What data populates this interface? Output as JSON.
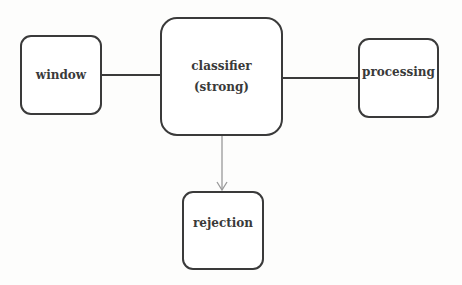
{
  "diagram": {
    "type": "flowchart",
    "nodes": [
      {
        "id": "window",
        "label": "window"
      },
      {
        "id": "classifier",
        "label": "classifier",
        "sublabel": "(strong)"
      },
      {
        "id": "processing",
        "label": "processing"
      },
      {
        "id": "rejection",
        "label": "rejection"
      }
    ],
    "edges": [
      {
        "from": "window",
        "to": "classifier",
        "style": "line",
        "color": "#3a3a3a"
      },
      {
        "from": "classifier",
        "to": "processing",
        "style": "line",
        "color": "#3a3a3a"
      },
      {
        "from": "classifier",
        "to": "rejection",
        "style": "arrow",
        "color": "#9a9a9a"
      }
    ]
  },
  "colors": {
    "border": "#3a3a3a",
    "arrow": "#9a9a9a",
    "background": "#fdfdfc"
  }
}
